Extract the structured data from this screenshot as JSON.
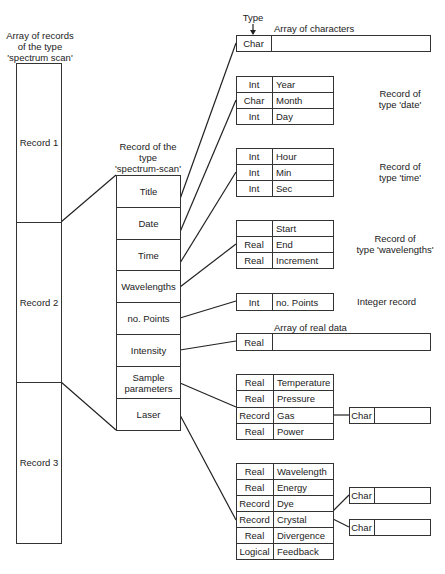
{
  "array": {
    "caption": [
      "Array of records",
      "of the type",
      "'spectrum scan'"
    ],
    "records": [
      "Record 1",
      "Record 2",
      "Record 3"
    ]
  },
  "record": {
    "caption": [
      "Record of the",
      "type",
      "'spectrum-scan'"
    ],
    "fields": [
      "Title",
      "Date",
      "Time",
      "Wavelengths",
      "no. Points",
      "Intensity",
      "Sample parameters",
      "Laser"
    ],
    "sample_line1": "Sample",
    "sample_line2": "parameters"
  },
  "type_pointer": {
    "label": "Type"
  },
  "title_block": {
    "caption": "Array of characters",
    "type": "Char"
  },
  "date_block": {
    "caption": [
      "Record of",
      "type 'date'"
    ],
    "rows": [
      {
        "type": "Int",
        "name": "Year"
      },
      {
        "type": "Char",
        "name": "Month"
      },
      {
        "type": "Int",
        "name": "Day"
      }
    ]
  },
  "time_block": {
    "caption": [
      "Record of",
      "type 'time'"
    ],
    "rows": [
      {
        "type": "Int",
        "name": "Hour"
      },
      {
        "type": "Int",
        "name": "Min"
      },
      {
        "type": "Int",
        "name": "Sec"
      }
    ]
  },
  "wavelengths_block": {
    "caption": [
      "Record of",
      "type 'wavelengths'"
    ],
    "rows": [
      {
        "type": "",
        "name": "Start"
      },
      {
        "type": "Real",
        "name": "End"
      },
      {
        "type": "Real",
        "name": "Increment"
      }
    ]
  },
  "points_block": {
    "caption": "Integer record",
    "type": "Int",
    "name": "no. Points"
  },
  "intensity_block": {
    "caption": "Array of real data",
    "type": "Real"
  },
  "sample_block": {
    "rows": [
      {
        "type": "Real",
        "name": "Temperature"
      },
      {
        "type": "Real",
        "name": "Pressure"
      },
      {
        "type": "Record",
        "name": "Gas"
      },
      {
        "type": "Real",
        "name": "Power"
      }
    ],
    "gas_char": "Char"
  },
  "laser_block": {
    "rows": [
      {
        "type": "Real",
        "name": "Wavelength"
      },
      {
        "type": "Real",
        "name": "Energy"
      },
      {
        "type": "Record",
        "name": "Dye"
      },
      {
        "type": "Record",
        "name": "Crystal"
      },
      {
        "type": "Real",
        "name": "Divergence"
      },
      {
        "type": "Logical",
        "name": "Feedback"
      }
    ],
    "dye_char": "Char",
    "crystal_char": "Char"
  }
}
